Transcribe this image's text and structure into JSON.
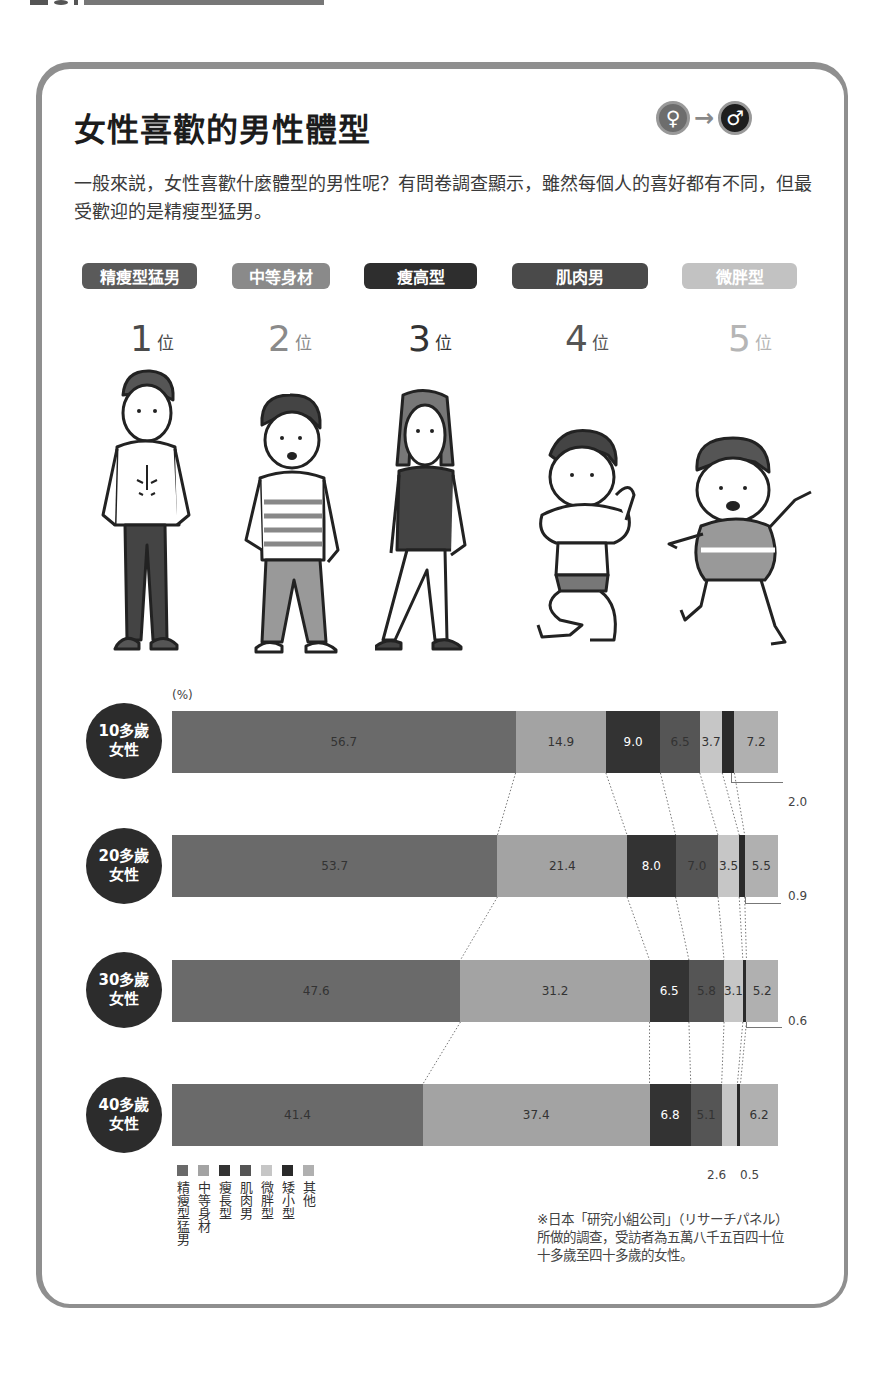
{
  "header": {
    "title": "女性喜歡的男性體型",
    "gender_from_icon": "♀",
    "gender_arrow": "→",
    "gender_to_icon": "♂",
    "intro": "一般來説，女性喜歡什麼體型的男性呢？有問卷調查顯示，雖然每個人的喜好都有不同，但最受歡迎的是精瘦型猛男。"
  },
  "ranking": [
    {
      "label": "精瘦型猛男",
      "rank": "1",
      "suffix": "位",
      "color": "#5a5a5a"
    },
    {
      "label": "中等身材",
      "rank": "2",
      "suffix": "位",
      "color": "#8a8a8a"
    },
    {
      "label": "瘦高型",
      "rank": "3",
      "suffix": "位",
      "color": "#2e2e2e"
    },
    {
      "label": "肌肉男",
      "rank": "4",
      "suffix": "位",
      "color": "#4a4a4a"
    },
    {
      "label": "微胖型",
      "rank": "5",
      "suffix": "位",
      "color": "#bdbdbd"
    }
  ],
  "chart_data": {
    "type": "bar",
    "orientation": "horizontal-stacked-100",
    "title": "女性喜歡的男性體型",
    "unit_label": "(%)",
    "categories": [
      "10多歲女性",
      "20多歲女性",
      "30多歲女性",
      "40多歲女性"
    ],
    "series": [
      {
        "name": "精瘦型猛男",
        "color": "#6a6a6a",
        "values": [
          56.7,
          53.7,
          47.6,
          41.4
        ]
      },
      {
        "name": "中等身材",
        "color": "#a3a3a3",
        "values": [
          14.9,
          21.4,
          31.2,
          37.4
        ]
      },
      {
        "name": "瘦長型",
        "color": "#333333",
        "values": [
          9.0,
          8.0,
          6.5,
          6.8
        ]
      },
      {
        "name": "肌肉男",
        "color": "#555555",
        "values": [
          6.5,
          7.0,
          5.8,
          5.1
        ]
      },
      {
        "name": "微胖型",
        "color": "#c6c6c6",
        "values": [
          3.7,
          3.5,
          3.1,
          2.6
        ]
      },
      {
        "name": "矮小型",
        "color": "#2a2a2a",
        "values": [
          2.0,
          0.9,
          0.6,
          0.5
        ]
      },
      {
        "name": "其他",
        "color": "#b0b0b0",
        "values": [
          7.2,
          5.5,
          5.2,
          6.2
        ]
      }
    ],
    "legend_position": "bottom-left",
    "grid": false
  },
  "age_groups": [
    {
      "line1": "10多歲",
      "line2": "女性"
    },
    {
      "line1": "20多歲",
      "line2": "女性"
    },
    {
      "line1": "30多歲",
      "line2": "女性"
    },
    {
      "line1": "40多歲",
      "line2": "女性"
    }
  ],
  "callouts": {
    "r0": "2.0",
    "r1": "0.9",
    "r2": "0.6",
    "r3a": "2.6",
    "r3b": "0.5"
  },
  "segment_labels": [
    [
      "56.7",
      "14.9",
      "9.0",
      "6.5",
      "3.7",
      "",
      "7.2"
    ],
    [
      "53.7",
      "21.4",
      "8.0",
      "7.0",
      "3.5",
      "",
      "5.5"
    ],
    [
      "47.6",
      "31.2",
      "6.5",
      "5.8",
      "3.1",
      "",
      "5.2"
    ],
    [
      "41.4",
      "37.4",
      "6.8",
      "5.1",
      "",
      "",
      "6.2"
    ]
  ],
  "legend": [
    "精瘦型猛男",
    "中等身材",
    "瘦長型",
    "肌肉男",
    "微胖型",
    "矮小型",
    "其他"
  ],
  "note": "※日本「研究小組公司」（リサーチパネル）所做的調查，受訪者為五萬八千五百四十位十多歲至四十多歲的女性。"
}
